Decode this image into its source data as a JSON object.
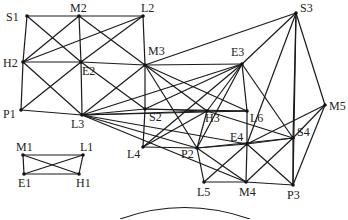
{
  "diagram": {
    "type": "network-graph",
    "colors": {
      "edge": "#1a1a1a",
      "node": "#111111",
      "label": "#222222",
      "background": "#ffffff"
    },
    "nodes": [
      {
        "id": "S1",
        "label": "S1",
        "x": 27,
        "y": 16,
        "lx": 6,
        "ly": 21
      },
      {
        "id": "M2",
        "label": "M2",
        "x": 79,
        "y": 16,
        "lx": 70,
        "ly": 12
      },
      {
        "id": "L2",
        "label": "L2",
        "x": 143,
        "y": 16,
        "lx": 141,
        "ly": 12
      },
      {
        "id": "H2",
        "label": "H2",
        "x": 23,
        "y": 62,
        "lx": 3,
        "ly": 67
      },
      {
        "id": "E2",
        "label": "E2",
        "x": 81,
        "y": 62,
        "lx": 82,
        "ly": 75
      },
      {
        "id": "M3",
        "label": "M3",
        "x": 145,
        "y": 65,
        "lx": 148,
        "ly": 55
      },
      {
        "id": "P1",
        "label": "P1",
        "x": 21,
        "y": 110,
        "lx": 3,
        "ly": 118
      },
      {
        "id": "L3",
        "label": "L3",
        "x": 82,
        "y": 115,
        "lx": 71,
        "ly": 128
      },
      {
        "id": "S2",
        "label": "S2",
        "x": 145,
        "y": 109,
        "lx": 149,
        "ly": 121
      },
      {
        "id": "L4",
        "label": "L4",
        "x": 143,
        "y": 147,
        "lx": 127,
        "ly": 158
      },
      {
        "id": "H3",
        "label": "H3",
        "x": 207,
        "y": 111,
        "lx": 205,
        "ly": 122
      },
      {
        "id": "L6",
        "label": "L6",
        "x": 247,
        "y": 111,
        "lx": 250,
        "ly": 122
      },
      {
        "id": "E3",
        "label": "E3",
        "x": 242,
        "y": 64,
        "lx": 231,
        "ly": 56
      },
      {
        "id": "S3",
        "label": "S3",
        "x": 296,
        "y": 13,
        "lx": 300,
        "ly": 12
      },
      {
        "id": "M5",
        "label": "M5",
        "x": 325,
        "y": 105,
        "lx": 329,
        "ly": 110
      },
      {
        "id": "S4",
        "label": "S4",
        "x": 293,
        "y": 138,
        "lx": 297,
        "ly": 136
      },
      {
        "id": "E4",
        "label": "E4",
        "x": 247,
        "y": 144,
        "lx": 230,
        "ly": 141
      },
      {
        "id": "P2",
        "label": "P2",
        "x": 197,
        "y": 148,
        "lx": 181,
        "ly": 158
      },
      {
        "id": "L5",
        "label": "L5",
        "x": 204,
        "y": 182,
        "lx": 197,
        "ly": 196
      },
      {
        "id": "M4",
        "label": "M4",
        "x": 246,
        "y": 182,
        "lx": 239,
        "ly": 196
      },
      {
        "id": "P3",
        "label": "P3",
        "x": 293,
        "y": 185,
        "lx": 287,
        "ly": 199
      },
      {
        "id": "M1",
        "label": "M1",
        "x": 23,
        "y": 155,
        "lx": 16,
        "ly": 151
      },
      {
        "id": "L1",
        "label": "L1",
        "x": 83,
        "y": 155,
        "lx": 80,
        "ly": 151
      },
      {
        "id": "E1",
        "label": "E1",
        "x": 24,
        "y": 174,
        "lx": 18,
        "ly": 187
      },
      {
        "id": "H1",
        "label": "H1",
        "x": 79,
        "y": 174,
        "lx": 76,
        "ly": 187
      }
    ],
    "edges": [
      [
        "S1",
        "M2"
      ],
      [
        "M2",
        "L2"
      ],
      [
        "S1",
        "H2"
      ],
      [
        "S1",
        "E2"
      ],
      [
        "M2",
        "H2"
      ],
      [
        "M2",
        "E2"
      ],
      [
        "M2",
        "M3"
      ],
      [
        "L2",
        "H2"
      ],
      [
        "L2",
        "E2"
      ],
      [
        "L2",
        "M3"
      ],
      [
        "H2",
        "E2"
      ],
      [
        "E2",
        "M3"
      ],
      [
        "H2",
        "P1"
      ],
      [
        "H2",
        "L3"
      ],
      [
        "E2",
        "P1"
      ],
      [
        "E2",
        "L3"
      ],
      [
        "E2",
        "S2"
      ],
      [
        "M3",
        "L3"
      ],
      [
        "P1",
        "L3"
      ],
      [
        "L3",
        "S2"
      ],
      [
        "M3",
        "S2"
      ],
      [
        "S2",
        "L4"
      ],
      [
        "M3",
        "S3"
      ],
      [
        "M3",
        "E3"
      ],
      [
        "M3",
        "H3"
      ],
      [
        "M3",
        "L6"
      ],
      [
        "M3",
        "P2"
      ],
      [
        "L3",
        "E3"
      ],
      [
        "L3",
        "H3"
      ],
      [
        "L3",
        "L6"
      ],
      [
        "L3",
        "P2"
      ],
      [
        "L3",
        "E4"
      ],
      [
        "L3",
        "M4"
      ],
      [
        "S2",
        "H3"
      ],
      [
        "S2",
        "L6"
      ],
      [
        "S2",
        "E3"
      ],
      [
        "L4",
        "E3"
      ],
      [
        "L4",
        "H3"
      ],
      [
        "L4",
        "P2"
      ],
      [
        "E3",
        "H3"
      ],
      [
        "E3",
        "L6"
      ],
      [
        "E3",
        "P2"
      ],
      [
        "E3",
        "S3"
      ],
      [
        "E3",
        "S4"
      ],
      [
        "S3",
        "E4"
      ],
      [
        "S3",
        "S4"
      ],
      [
        "S3",
        "M5"
      ],
      [
        "S3",
        "P3"
      ],
      [
        "H3",
        "L6"
      ],
      [
        "H3",
        "P2"
      ],
      [
        "H3",
        "S4"
      ],
      [
        "L6",
        "E4"
      ],
      [
        "M5",
        "S4"
      ],
      [
        "M5",
        "P3"
      ],
      [
        "M5",
        "E4"
      ],
      [
        "P2",
        "E4"
      ],
      [
        "P2",
        "S4"
      ],
      [
        "P2",
        "L5"
      ],
      [
        "P2",
        "M4"
      ],
      [
        "E4",
        "S4"
      ],
      [
        "E4",
        "L5"
      ],
      [
        "E4",
        "M4"
      ],
      [
        "E4",
        "P3"
      ],
      [
        "S4",
        "M4"
      ],
      [
        "S4",
        "P3"
      ],
      [
        "L5",
        "M4"
      ],
      [
        "M4",
        "P3"
      ],
      [
        "M1",
        "L1"
      ],
      [
        "M1",
        "E1"
      ],
      [
        "M1",
        "H1"
      ],
      [
        "L1",
        "E1"
      ],
      [
        "L1",
        "H1"
      ],
      [
        "E1",
        "H1"
      ]
    ],
    "partial_arc": {
      "x1": 120,
      "y1": 219,
      "cx": 184,
      "cy": 196,
      "x2": 250,
      "y2": 219
    }
  }
}
